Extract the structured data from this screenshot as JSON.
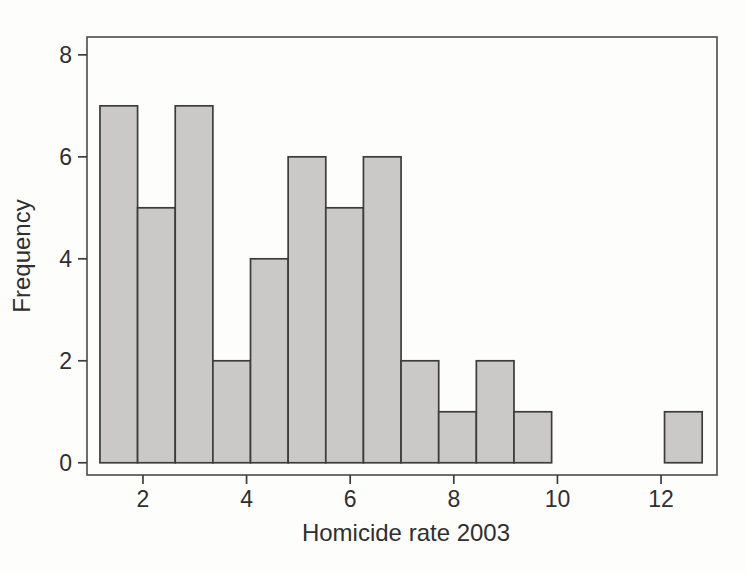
{
  "figure": {
    "background": "#fdfdfc"
  },
  "chart_data": {
    "type": "bar",
    "subtype": "histogram",
    "title": "",
    "xlabel": "Homicide rate 2003",
    "ylabel": "Frequency",
    "xlim": [
      0.92,
      13.08
    ],
    "ylim": [
      -0.24,
      8.35
    ],
    "x_ticks": [
      2,
      4,
      6,
      8,
      10,
      12
    ],
    "y_ticks": [
      0,
      2,
      4,
      6,
      8
    ],
    "grid": false,
    "legend": "none",
    "bins": {
      "start": 1.17,
      "width": 0.7265,
      "counts": [
        7,
        5,
        7,
        2,
        4,
        6,
        5,
        6,
        2,
        1,
        2,
        1,
        0,
        0,
        0,
        1
      ]
    },
    "colors": {
      "bar_fill": "#cac9c7",
      "bar_stroke": "#3c3c3c",
      "frame_stroke": "#4a4a4a",
      "tick_stroke": "#3c3c3c",
      "text": "#2f2f2f"
    }
  }
}
